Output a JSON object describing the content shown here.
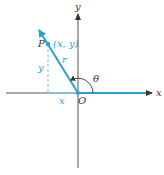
{
  "diagram": {
    "labels": {
      "x_axis": "x",
      "y_axis": "y",
      "origin": "O",
      "point": "P",
      "point_coords": "(x, y)",
      "radius": "r",
      "angle": "θ",
      "x_length": "x",
      "y_length": "y"
    },
    "colors": {
      "axis": "#333333",
      "ray": "#2a9fd6",
      "dashed": "#7cc4e8",
      "label_dark": "#333333",
      "label_blue": "#2a9fd6"
    }
  }
}
